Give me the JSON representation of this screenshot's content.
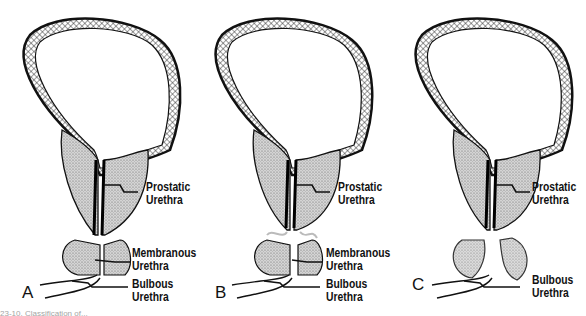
{
  "figure": {
    "caption_fragment": "23-10. Classification of...",
    "panels": [
      {
        "letter": "A",
        "labels": {
          "prostatic": "Prostatic\nUrethra",
          "membranous": "Membranous\nUrethra",
          "bulbous": "Bulbous\nUrethra"
        }
      },
      {
        "letter": "B",
        "labels": {
          "prostatic": "Prostatic\nUrethra",
          "membranous": "Membranous\nUrethra",
          "bulbous": "Bulbous\nUrethra"
        }
      },
      {
        "letter": "C",
        "labels": {
          "prostatic": "Prostatic\nUrethra",
          "bulbous": "Bulbous\nUrethra"
        }
      }
    ]
  }
}
